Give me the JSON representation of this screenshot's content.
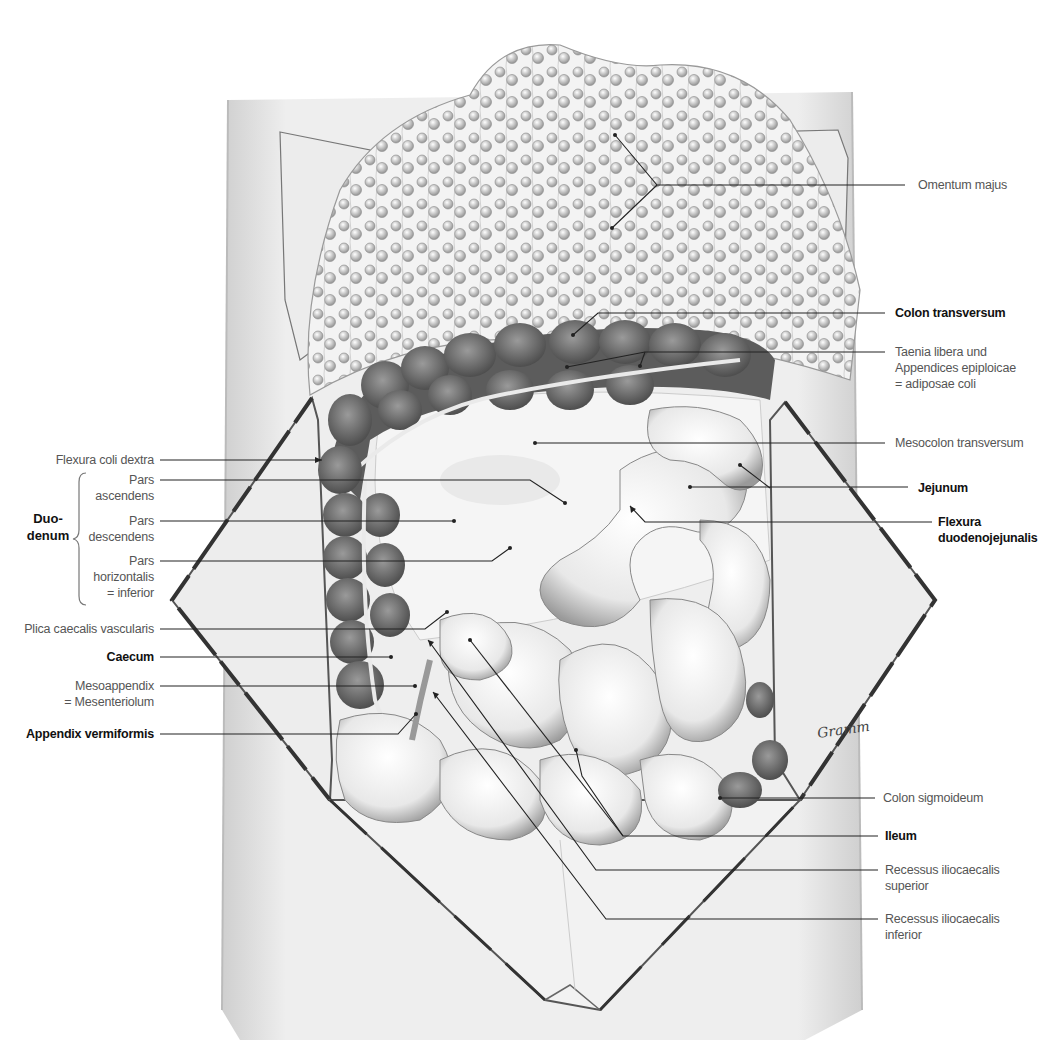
{
  "figure": {
    "type": "anatomical-illustration",
    "colors": {
      "background": "#ffffff",
      "label_regular": "#555555",
      "label_bold": "#111111",
      "leader": "#222222",
      "colon": "#6e6e6e",
      "skin": "#e6e6e6"
    }
  },
  "labels": {
    "right": [
      {
        "id": "omentum-majus",
        "text": "Omentum majus",
        "bold": false,
        "x": 918,
        "y": 175
      },
      {
        "id": "colon-transversum",
        "text": "Colon transversum",
        "bold": true,
        "x": 895,
        "y": 305
      },
      {
        "id": "taenia-libera",
        "line1": "Taenia libera und",
        "line2": "Appendices epiploicae",
        "line3": "= adiposae coli",
        "bold": false,
        "x": 895,
        "y": 343
      },
      {
        "id": "mesocolon-transversum",
        "text": "Mesocolon transversum",
        "bold": false,
        "x": 895,
        "y": 435
      },
      {
        "id": "jejunum",
        "text": "Jejunum",
        "bold": true,
        "x": 920,
        "y": 482
      },
      {
        "id": "flexura-duodenojejunalis",
        "line1": "Flexura",
        "line2": "duodenojejunalis",
        "bold": true,
        "x": 940,
        "y": 515
      },
      {
        "id": "colon-sigmoideum",
        "text": "Colon sigmoideum",
        "bold": false,
        "x": 883,
        "y": 795
      },
      {
        "id": "ileum",
        "text": "Ileum",
        "bold": true,
        "x": 885,
        "y": 829
      },
      {
        "id": "recessus-superior",
        "line1": "Recessus iliocaecalis",
        "line2": "superior",
        "bold": false,
        "x": 885,
        "y": 863
      },
      {
        "id": "recessus-inferior",
        "line1": "Recessus iliocaecalis",
        "line2": "inferior",
        "bold": false,
        "x": 885,
        "y": 912
      }
    ],
    "left": [
      {
        "id": "flexura-coli-dextra",
        "text": "Flexura coli dextra",
        "bold": false,
        "right": 910,
        "y": 453
      },
      {
        "id": "pars-ascendens",
        "line1": "Pars",
        "line2": "ascendens",
        "bold": false,
        "right": 910,
        "y": 474
      },
      {
        "id": "pars-descendens",
        "line1": "Pars",
        "line2": "descendens",
        "bold": false,
        "right": 910,
        "y": 515
      },
      {
        "id": "pars-horizontalis",
        "line1": "Pars",
        "line2": "horizontalis",
        "line3": "= inferior",
        "bold": false,
        "right": 910,
        "y": 555
      },
      {
        "id": "plica-caecalis",
        "text": "Plica caecalis vascularis",
        "bold": false,
        "right": 910,
        "y": 622
      },
      {
        "id": "caecum",
        "text": "Caecum",
        "bold": true,
        "right": 910,
        "y": 651
      },
      {
        "id": "mesoappendix",
        "line1": "Mesoappendix",
        "line2": "= Mesenteriolum",
        "bold": false,
        "right": 910,
        "y": 679
      },
      {
        "id": "appendix-vermiformis",
        "text": "Appendix vermiformis",
        "bold": true,
        "right": 910,
        "y": 724
      }
    ],
    "group": {
      "id": "duodenum",
      "line1": "Duo-",
      "line2": "denum",
      "bold": true
    }
  },
  "signature": "Gramm"
}
